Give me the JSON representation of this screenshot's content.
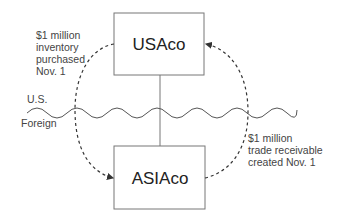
{
  "diagram": {
    "entities": [
      {
        "id": "usaco",
        "label": "USAco"
      },
      {
        "id": "asiaco",
        "label": "ASIAco"
      }
    ],
    "border": {
      "upper_label": "U.S.",
      "lower_label": "Foreign"
    },
    "flows": [
      {
        "from": "usaco",
        "to": "asiaco",
        "lines": [
          "$1 million",
          "inventory",
          "purchased",
          "Nov. 1"
        ]
      },
      {
        "from": "asiaco",
        "to": "usaco",
        "lines": [
          "$1 million",
          "trade receivable",
          "created Nov. 1"
        ]
      }
    ],
    "colors": {
      "stroke": "#555555",
      "text": "#444444"
    }
  }
}
